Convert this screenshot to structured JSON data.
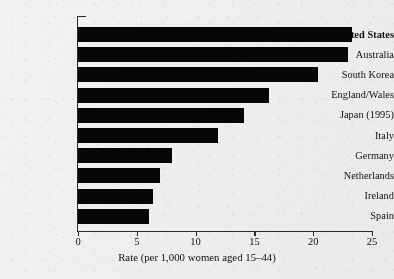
{
  "chart_data": {
    "type": "bar",
    "orientation": "horizontal",
    "title": "",
    "xlabel": "Rate (per 1,000 women aged 15–44)",
    "ylabel": "",
    "categories": [
      "United States",
      "Australia",
      "South Korea",
      "England/Wales",
      "Japan (1995)",
      "Italy",
      "Germany",
      "Netherlands",
      "Ireland",
      "Spain"
    ],
    "values": [
      23.3,
      23.0,
      20.4,
      16.2,
      14.1,
      11.9,
      8.0,
      7.0,
      6.4,
      6.0
    ],
    "emphasized_category": "United States",
    "xlim": [
      0,
      25
    ],
    "xticks": [
      0,
      5,
      10,
      15,
      20,
      25
    ],
    "xtick_labels": [
      "0",
      "5",
      "10",
      "15",
      "20",
      "25"
    ],
    "grid": false,
    "legend": null,
    "bar_color": "#060606",
    "background_color": "#f3f2f0",
    "axis_color": "#2b2a28"
  }
}
